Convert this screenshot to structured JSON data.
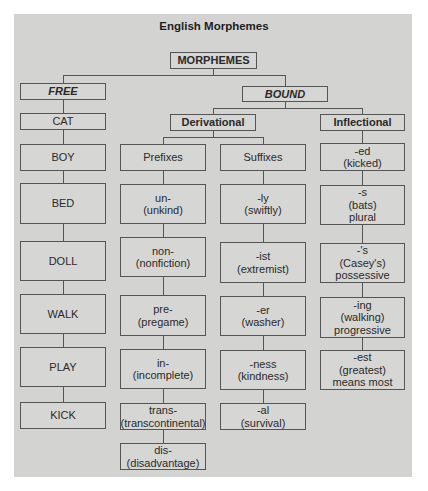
{
  "title": "English Morphemes",
  "root": {
    "label": "MORPHEMES"
  },
  "free": {
    "label": "FREE",
    "items": [
      "CAT",
      "BOY",
      "BED",
      "DOLL",
      "WALK",
      "PLAY",
      "KICK"
    ]
  },
  "bound": {
    "label": "BOUND",
    "derivational": {
      "label": "Derivational",
      "prefixes": {
        "label": "Prefixes",
        "items": [
          {
            "affix": "un-",
            "example": "(unkind)"
          },
          {
            "affix": "non-",
            "example": "(nonfiction)"
          },
          {
            "affix": "pre-",
            "example": "(pregame)"
          },
          {
            "affix": "in-",
            "example": "(incomplete)"
          },
          {
            "affix": "trans-",
            "example": "(transcontinental)"
          },
          {
            "affix": "dis-",
            "example": "(disadvantage)"
          }
        ]
      },
      "suffixes": {
        "label": "Suffixes",
        "items": [
          {
            "affix": "-ly",
            "example": "(swiftly)"
          },
          {
            "affix": "-ist",
            "example": "(extremist)"
          },
          {
            "affix": "-er",
            "example": "(washer)"
          },
          {
            "affix": "-ness",
            "example": "(kindness)"
          },
          {
            "affix": "-al",
            "example": "(survival)"
          }
        ]
      }
    },
    "inflectional": {
      "label": "Inflectional",
      "items": [
        {
          "affix": "-ed",
          "example": "(kicked)",
          "note": ""
        },
        {
          "affix": "-s",
          "example": "(bats)",
          "note": "plural"
        },
        {
          "affix": "-'s",
          "example": "(Casey's)",
          "note": "possessive"
        },
        {
          "affix": "-ing",
          "example": "(walking)",
          "note": "progressive"
        },
        {
          "affix": "-est",
          "example": "(greatest)",
          "note": "means most"
        }
      ]
    }
  },
  "colors": {
    "background": "#d3d3d1",
    "border": "#555555",
    "text": "#2a2a2a"
  }
}
